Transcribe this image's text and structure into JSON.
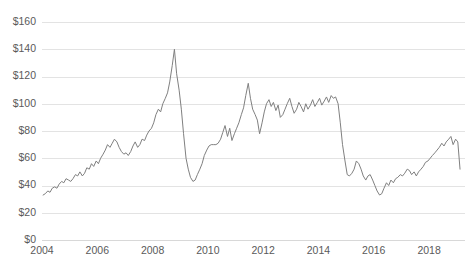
{
  "chart_data": {
    "type": "line",
    "title": "",
    "subtitle": "",
    "xlabel": "",
    "ylabel": "",
    "xlim": [
      2004.0,
      2019.3
    ],
    "ylim": [
      0,
      160
    ],
    "grid": true,
    "legend": false,
    "legend_position": "none",
    "line_color": "#808080",
    "grid_color": "#e3e3e3",
    "tick_label_color": "#5a5a5a",
    "background_color": "#ffffff",
    "y_ticks": [
      0,
      20,
      40,
      60,
      80,
      100,
      120,
      140,
      160
    ],
    "y_tick_labels": [
      "$0",
      "$20",
      "$40",
      "$60",
      "$80",
      "$100",
      "$120",
      "$140",
      "$160"
    ],
    "x_ticks": [
      2004,
      2006,
      2008,
      2010,
      2012,
      2014,
      2016,
      2018
    ],
    "x_tick_labels": [
      "2004",
      "2006",
      "2008",
      "2010",
      "2012",
      "2014",
      "2016",
      "2018"
    ],
    "series": [
      {
        "name": "Price",
        "x": [
          2004.04,
          2004.12,
          2004.21,
          2004.29,
          2004.37,
          2004.46,
          2004.54,
          2004.62,
          2004.71,
          2004.79,
          2004.87,
          2004.96,
          2005.04,
          2005.12,
          2005.21,
          2005.29,
          2005.37,
          2005.46,
          2005.54,
          2005.62,
          2005.71,
          2005.79,
          2005.87,
          2005.96,
          2006.04,
          2006.12,
          2006.21,
          2006.29,
          2006.37,
          2006.46,
          2006.54,
          2006.62,
          2006.71,
          2006.79,
          2006.87,
          2006.96,
          2007.04,
          2007.12,
          2007.21,
          2007.29,
          2007.37,
          2007.46,
          2007.54,
          2007.62,
          2007.71,
          2007.79,
          2007.87,
          2007.96,
          2008.04,
          2008.12,
          2008.21,
          2008.29,
          2008.37,
          2008.46,
          2008.54,
          2008.62,
          2008.71,
          2008.79,
          2008.87,
          2008.96,
          2009.04,
          2009.12,
          2009.21,
          2009.29,
          2009.37,
          2009.46,
          2009.54,
          2009.62,
          2009.71,
          2009.79,
          2009.87,
          2009.96,
          2010.04,
          2010.12,
          2010.21,
          2010.29,
          2010.37,
          2010.46,
          2010.54,
          2010.62,
          2010.71,
          2010.79,
          2010.87,
          2010.96,
          2011.04,
          2011.12,
          2011.21,
          2011.29,
          2011.37,
          2011.46,
          2011.54,
          2011.62,
          2011.71,
          2011.79,
          2011.87,
          2011.96,
          2012.04,
          2012.12,
          2012.21,
          2012.29,
          2012.37,
          2012.46,
          2012.54,
          2012.62,
          2012.71,
          2012.79,
          2012.87,
          2012.96,
          2013.04,
          2013.12,
          2013.21,
          2013.29,
          2013.37,
          2013.46,
          2013.54,
          2013.62,
          2013.71,
          2013.79,
          2013.87,
          2013.96,
          2014.04,
          2014.12,
          2014.21,
          2014.29,
          2014.37,
          2014.46,
          2014.54,
          2014.62,
          2014.71,
          2014.79,
          2014.87,
          2014.96,
          2015.04,
          2015.12,
          2015.21,
          2015.29,
          2015.37,
          2015.46,
          2015.54,
          2015.62,
          2015.71,
          2015.79,
          2015.87,
          2015.96,
          2016.04,
          2016.12,
          2016.21,
          2016.29,
          2016.37,
          2016.46,
          2016.54,
          2016.62,
          2016.71,
          2016.79,
          2016.87,
          2016.96,
          2017.04,
          2017.12,
          2017.21,
          2017.29,
          2017.37,
          2017.46,
          2017.54,
          2017.62,
          2017.71,
          2017.79,
          2017.87,
          2017.96,
          2018.04,
          2018.12,
          2018.21,
          2018.29,
          2018.37,
          2018.46,
          2018.54,
          2018.62,
          2018.71,
          2018.79,
          2018.87,
          2018.96,
          2019.04,
          2019.12
        ],
        "values": [
          33,
          34,
          36,
          35,
          38,
          39,
          38,
          41,
          43,
          42,
          45,
          44,
          43,
          45,
          48,
          47,
          50,
          47,
          49,
          53,
          52,
          56,
          54,
          58,
          56,
          60,
          63,
          66,
          70,
          68,
          71,
          74,
          72,
          68,
          65,
          63,
          64,
          62,
          65,
          69,
          72,
          68,
          70,
          74,
          73,
          77,
          80,
          82,
          86,
          92,
          96,
          94,
          100,
          104,
          108,
          116,
          128,
          140,
          122,
          110,
          96,
          78,
          60,
          52,
          46,
          43,
          44,
          48,
          52,
          56,
          62,
          66,
          69,
          70,
          70,
          70,
          71,
          74,
          79,
          84,
          76,
          82,
          73,
          78,
          82,
          86,
          92,
          97,
          106,
          115,
          104,
          96,
          92,
          88,
          78,
          86,
          94,
          100,
          103,
          98,
          101,
          95,
          99,
          90,
          92,
          96,
          100,
          104,
          98,
          93,
          96,
          101,
          98,
          94,
          100,
          96,
          99,
          103,
          98,
          101,
          104,
          99,
          102,
          105,
          101,
          106,
          104,
          105,
          100,
          86,
          70,
          58,
          48,
          47,
          49,
          52,
          58,
          56,
          52,
          47,
          44,
          47,
          48,
          44,
          40,
          36,
          33,
          34,
          38,
          42,
          40,
          44,
          42,
          45,
          46,
          48,
          47,
          49,
          52,
          51,
          48,
          50,
          47,
          50,
          52,
          54,
          57,
          58,
          60,
          62,
          64,
          66,
          68,
          71,
          69,
          72,
          74,
          76,
          70,
          74,
          72,
          52
        ]
      }
    ],
    "annotations": []
  },
  "chart_meta": {
    "plot_left": 42,
    "plot_right": 465,
    "plot_top": 22,
    "plot_bottom": 240
  }
}
